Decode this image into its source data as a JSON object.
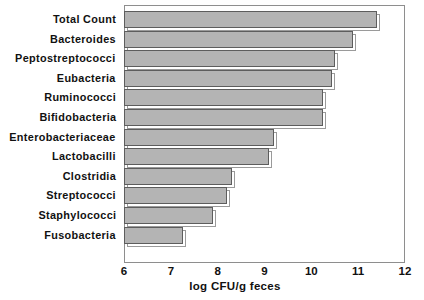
{
  "chart_data": {
    "type": "bar",
    "orientation": "horizontal",
    "title": "",
    "xlabel": "log CFU/g feces",
    "ylabel": "",
    "xlim": [
      6,
      12
    ],
    "xticks": [
      6,
      7,
      8,
      9,
      10,
      11,
      12
    ],
    "grid": false,
    "legend": null,
    "categories": [
      "Total Count",
      "Bacteroides",
      "Peptostreptococci",
      "Eubacteria",
      "Ruminococci",
      "Bifidobacteria",
      "Enterobacteriaceae",
      "Lactobacilli",
      "Clostridia",
      "Streptococci",
      "Staphylococci",
      "Fusobacteria"
    ],
    "values": [
      11.4,
      10.9,
      10.5,
      10.45,
      10.25,
      10.25,
      9.2,
      9.1,
      8.3,
      8.2,
      7.9,
      7.25
    ],
    "bar_fill_color": "#b4b4b4",
    "bar_edge_color": "#5d5d5d",
    "frame_color": "#8e8e8e",
    "background_color": "#ffffff",
    "text_color": "#111111"
  }
}
